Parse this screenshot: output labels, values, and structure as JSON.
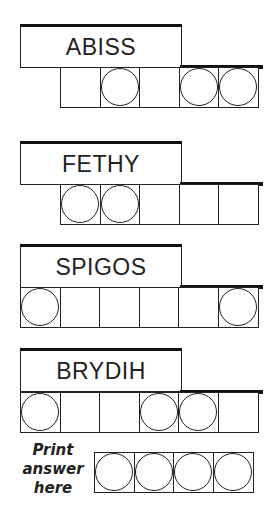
{
  "puzzle": {
    "words": [
      {
        "scrambled": "ABISS",
        "cells": 5,
        "circled": [
          1,
          3,
          4
        ],
        "offset": 1
      },
      {
        "scrambled": "FETHY",
        "cells": 5,
        "circled": [
          0,
          1
        ],
        "offset": 1
      },
      {
        "scrambled": "SPIGOS",
        "cells": 6,
        "circled": [
          0,
          5
        ],
        "offset": 0
      },
      {
        "scrambled": "BRYDIH",
        "cells": 6,
        "circled": [
          0,
          3,
          4
        ],
        "offset": 0
      }
    ],
    "answer_label_lines": [
      "Print",
      "answer",
      "here"
    ],
    "answer_cells": 4
  }
}
